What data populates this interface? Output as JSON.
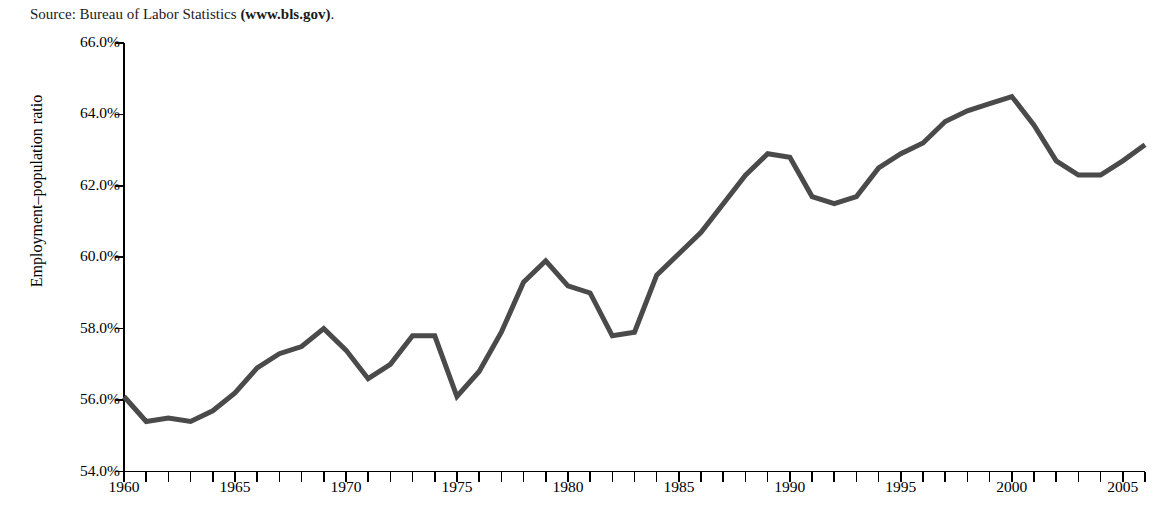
{
  "source_note": {
    "prefix": "Source: Bureau of Labor Statistics ",
    "link_text": "(www.bls.gov)",
    "suffix": "."
  },
  "chart_data": {
    "type": "line",
    "title": "",
    "subtitle": "",
    "xlabel": "",
    "ylabel": "Employment–population ratio",
    "xlim": [
      1960,
      2006
    ],
    "ylim": [
      54.0,
      66.0
    ],
    "grid": false,
    "legend": null,
    "line_color": "#4a4a4a",
    "line_width": 5,
    "axis_color": "#000000",
    "x_tick_interval": 1,
    "x_label_interval": 5,
    "y_tick_interval": 2.0,
    "y_tick_labels": [
      "66.0%",
      "64.0%",
      "62.0%",
      "60.0%",
      "58.0%",
      "56.0%",
      "54.0%"
    ],
    "y_tick_values": [
      66.0,
      64.0,
      62.0,
      60.0,
      58.0,
      56.0,
      54.0
    ],
    "x_tick_labels": [
      "1960",
      "1965",
      "1970",
      "1975",
      "1980",
      "1985",
      "1990",
      "1995",
      "2000",
      "2005"
    ],
    "x_tick_values": [
      1960,
      1965,
      1970,
      1975,
      1980,
      1985,
      1990,
      1995,
      2000,
      2005
    ],
    "x": [
      1960,
      1961,
      1962,
      1963,
      1964,
      1965,
      1966,
      1967,
      1968,
      1969,
      1970,
      1971,
      1972,
      1973,
      1974,
      1975,
      1976,
      1977,
      1978,
      1979,
      1980,
      1981,
      1982,
      1983,
      1984,
      1985,
      1986,
      1987,
      1988,
      1989,
      1990,
      1991,
      1992,
      1993,
      1994,
      1995,
      1996,
      1997,
      1998,
      1999,
      2000,
      2001,
      2002,
      2003,
      2004,
      2005,
      2006
    ],
    "values": [
      56.1,
      55.4,
      55.5,
      55.4,
      55.7,
      56.2,
      56.9,
      57.3,
      57.5,
      58.0,
      57.4,
      56.6,
      57.0,
      57.8,
      57.8,
      56.1,
      56.8,
      57.9,
      59.3,
      59.9,
      59.2,
      59.0,
      57.8,
      57.9,
      59.5,
      60.1,
      60.7,
      61.5,
      62.3,
      62.9,
      62.8,
      61.7,
      61.5,
      61.7,
      62.5,
      62.9,
      63.2,
      63.8,
      64.1,
      64.3,
      64.5,
      63.7,
      62.7,
      62.3,
      62.3,
      62.7,
      63.15
    ],
    "data_label": "Employment–population ratio"
  }
}
